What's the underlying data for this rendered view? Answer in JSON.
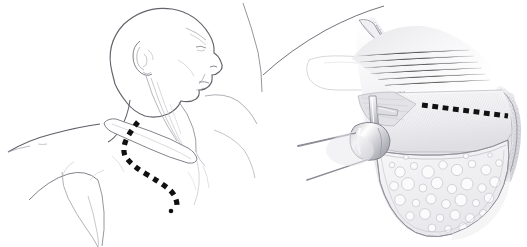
{
  "figure": {
    "title": "Supraclavicular and sternal incision with subplatysmal flap exposure",
    "type": "medical-surgical-illustration",
    "style": "pen-and-ink line drawing with grayscale wash",
    "background_color": "#ffffff",
    "width": 527,
    "height": 247,
    "panel_count": 2
  },
  "colors": {
    "background": "#ffffff",
    "outline_dark": "#4a4a52",
    "outline_mid": "#7d7d86",
    "outline_light": "#b6b6bd",
    "outline_faint": "#d2d2d8",
    "incision_dash": "#111111",
    "skin_fill": "#ffffff",
    "flap_fill_light": "#f2f2f4",
    "flap_fill_mid": "#e3e3e7",
    "flap_fill_dark": "#c9c9cf",
    "fat_fill": "#efeff1",
    "fat_cell_stroke": "#c0c0c7",
    "instrument_fill": "#dcdce1",
    "instrument_shine": "#ffffff",
    "muscle_hatch": "#cfcfd6",
    "dermis_stipple": "#9a9aa2"
  },
  "panels": [
    {
      "id": "panel-left",
      "name": "patient-profile-panel",
      "label": "Patient in supine position, head turned, incision marked",
      "x": 0,
      "y": 0,
      "width": 264,
      "height": 247,
      "anatomy": [
        {
          "name": "cranium",
          "label": "Skull / scalp"
        },
        {
          "name": "face-profile",
          "label": "Face in profile, chin elevated"
        },
        {
          "name": "ear-auricle",
          "label": "Auricle (external ear)"
        },
        {
          "name": "mandible",
          "label": "Mandible border"
        },
        {
          "name": "neck",
          "label": "Neck"
        },
        {
          "name": "sternocleidomastoid",
          "label": "Sternocleidomastoid muscle"
        },
        {
          "name": "clavicle",
          "label": "Clavicle"
        },
        {
          "name": "sternal-notch",
          "label": "Suprasternal notch"
        },
        {
          "name": "sternum",
          "label": "Sternum"
        },
        {
          "name": "shoulder",
          "label": "Shoulder / deltoid"
        },
        {
          "name": "pectoral-region",
          "label": "Pectoral region"
        },
        {
          "name": "axilla",
          "label": "Axillary fold"
        },
        {
          "name": "upper-arm",
          "label": "Upper arm"
        }
      ],
      "incision": {
        "name": "planned-incision-line",
        "label": "Planned skin incision (dashed)",
        "style": "dashed",
        "dash_color": "#111111",
        "dash_width": 5,
        "segments": [
          "Supraclavicular limb along upper border of clavicle",
          "Vertical limb descending over the manubrium / sternum"
        ]
      }
    },
    {
      "id": "panel-right",
      "name": "surgical-exposure-panel",
      "label": "Magnified operative field: elevated flap retracted, dashed line marks deep incision",
      "x": 263,
      "y": 0,
      "width": 264,
      "height": 247,
      "anatomy": [
        {
          "name": "skin-flap",
          "label": "Elevated skin and subcutaneous flap"
        },
        {
          "name": "dermal-edge",
          "label": "Cut dermal edge (stippled)"
        },
        {
          "name": "subcutaneous-fat",
          "label": "Subcutaneous fat, lobulated"
        },
        {
          "name": "platysma-muscle",
          "label": "Platysma / muscle layer, hatched"
        },
        {
          "name": "fascia-plane",
          "label": "Fascial plane"
        },
        {
          "name": "clavicle-shadow",
          "label": "Clavicle beneath field (faint outline)"
        },
        {
          "name": "body-contour",
          "label": "Body surface contour line"
        }
      ],
      "instruments": [
        {
          "name": "retractor-hook",
          "label": "Double-prong skin hook retractor"
        },
        {
          "name": "retractor-handle",
          "label": "Retractor shaft"
        },
        {
          "name": "dissector-blade",
          "label": "Dissector blade elevating flap"
        }
      ],
      "incision": {
        "name": "deep-incision-line",
        "label": "Dashed line marking deep incision across muscle",
        "style": "dashed",
        "dash_color": "#111111",
        "dash_width": 5,
        "orientation": "roughly horizontal, sloping slightly downward to the right"
      }
    }
  ],
  "annotations": {
    "labels_visible": false,
    "text_present": "none",
    "note": "No printed text, numbers, letters or callouts appear in this illustration"
  }
}
